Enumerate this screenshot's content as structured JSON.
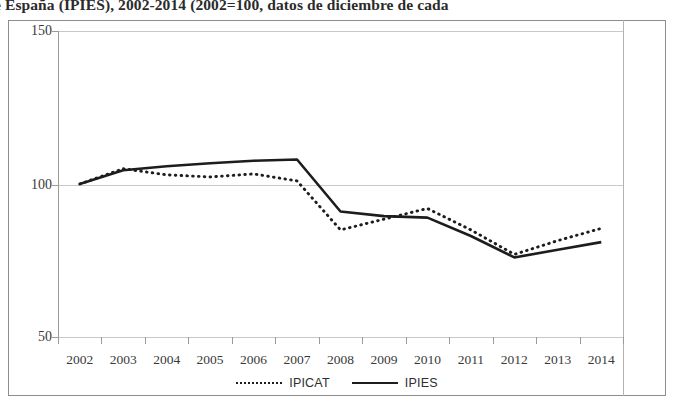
{
  "caption": {
    "text": "e España (IPIES), 2002-2014 (2002=100, datos de diciembre de cada"
  },
  "legend": {
    "position": "bottom-center",
    "items": [
      {
        "label": "IPICAT",
        "style": "dotted"
      },
      {
        "label": "IPIES",
        "style": "solid"
      }
    ]
  },
  "axes": {
    "y_ticks": [
      "150",
      "100",
      "50"
    ],
    "x_ticks": [
      "2002",
      "2003",
      "2004",
      "2005",
      "2006",
      "2007",
      "2008",
      "2009",
      "2010",
      "2011",
      "2012",
      "2013",
      "2014"
    ]
  },
  "colors": {
    "line": "#1d1d1d",
    "grid": "#c9c9c9",
    "axis": "#9a9a9a",
    "frame": "#8d8d8d",
    "text": "#3a3a3a"
  },
  "chart_data": {
    "type": "line",
    "title": "e España (IPIES), 2002-2014 (2002=100, datos de diciembre de cada",
    "xlabel": "",
    "ylabel": "",
    "x": [
      "2002",
      "2003",
      "2004",
      "2005",
      "2006",
      "2007",
      "2008",
      "2009",
      "2010",
      "2011",
      "2012",
      "2013",
      "2014"
    ],
    "categories": [
      "2002",
      "2003",
      "2004",
      "2005",
      "2006",
      "2007",
      "2008",
      "2009",
      "2010",
      "2011",
      "2012",
      "2013",
      "2014"
    ],
    "ylim": [
      50,
      150
    ],
    "yticks": [
      50,
      100,
      150
    ],
    "grid": true,
    "legend_position": "bottom",
    "series": [
      {
        "name": "IPICAT",
        "style": "dotted",
        "values": [
          100,
          105,
          103,
          102.3,
          103.3,
          101,
          85,
          88.5,
          92,
          85,
          77,
          81.5,
          85.5
        ]
      },
      {
        "name": "IPIES",
        "style": "solid",
        "values": [
          100,
          104.5,
          105.8,
          106.8,
          107.6,
          108,
          91,
          89.5,
          89,
          83,
          76,
          78.5,
          81
        ]
      }
    ]
  }
}
